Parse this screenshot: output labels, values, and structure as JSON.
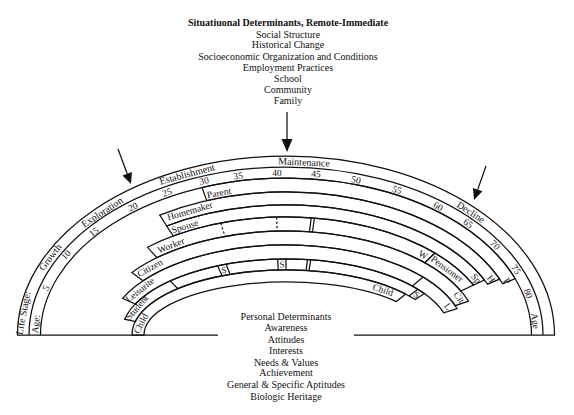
{
  "header": {
    "title": "Situatiuonal Determinants, Remote-Immediate",
    "items": [
      "Social Structure",
      "Historical Change",
      "Socioeconomic Organization and Conditions",
      "Employment Practices",
      "School",
      "Community",
      "Family"
    ]
  },
  "footer": {
    "title": "Personal Determinants",
    "items": [
      "Awareness",
      "Attitudes",
      "Interests",
      "Needs & Values",
      "Achievement",
      "General & Specific Aptitudes",
      "Biologic Heritage"
    ]
  },
  "life_stage": {
    "label": "Life Stage:",
    "stages": [
      "Growth",
      "Exploration",
      "Establishment",
      "Maintenance",
      "Decline"
    ]
  },
  "age": {
    "label_start": "Age:",
    "label_end": "Age",
    "ticks": [
      "5",
      "10",
      "15",
      "20",
      "25",
      "30",
      "35",
      "40",
      "45",
      "50",
      "55",
      "60",
      "65",
      "70",
      "75",
      "80"
    ]
  },
  "roles": {
    "parent": {
      "label": "Parent",
      "end_label": "P"
    },
    "homemaker": {
      "label": "Homemaker",
      "end_label": "H"
    },
    "spouse": {
      "label": "Spouse",
      "end_label": "Sp"
    },
    "worker": {
      "label": "Worker",
      "end_label": "W"
    },
    "pensioner": {
      "label": "Pensioner"
    },
    "citizen": {
      "label": "Citizen",
      "end_label": "Cit"
    },
    "leisurite": {
      "label": "Leisurite",
      "end_label": "L"
    },
    "student": {
      "label": "Student",
      "end_label": "S",
      "markers": [
        "S",
        "S"
      ]
    },
    "child": {
      "label": "Child",
      "end_label": "Child"
    }
  },
  "colors": {
    "line": "#111111",
    "background": "#ffffff"
  }
}
